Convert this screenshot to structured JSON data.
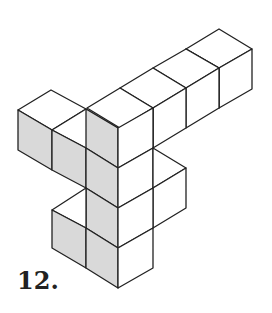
{
  "figure": {
    "label": "12.",
    "shade_color": "#d9d9d9",
    "line_color": "#222222"
  }
}
